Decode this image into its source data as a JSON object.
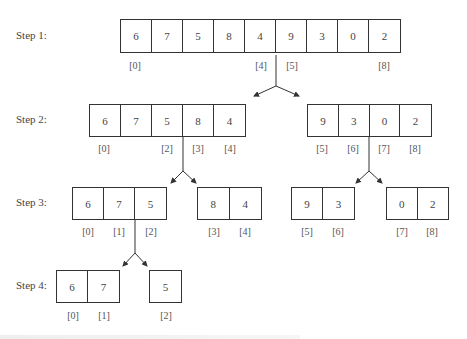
{
  "diagram": {
    "steps": [
      {
        "label": "Step 1:",
        "arrays": [
          {
            "values": [
              "6",
              "7",
              "5",
              "8",
              "4",
              "9",
              "3",
              "0",
              "2"
            ],
            "index_labels": [
              {
                "pos": 0,
                "text": "[0]"
              },
              {
                "pos": 4,
                "text": "[4]"
              },
              {
                "pos": 5,
                "text": "[5]"
              },
              {
                "pos": 8,
                "text": "[8]"
              }
            ]
          }
        ]
      },
      {
        "label": "Step 2:",
        "arrays": [
          {
            "values": [
              "6",
              "7",
              "5",
              "8",
              "4"
            ],
            "index_labels": [
              {
                "pos": 0,
                "text": "[0]"
              },
              {
                "pos": 2,
                "text": "[2]"
              },
              {
                "pos": 3,
                "text": "[3]"
              },
              {
                "pos": 4,
                "text": "[4]"
              }
            ]
          },
          {
            "values": [
              "9",
              "3",
              "0",
              "2"
            ],
            "index_labels": [
              {
                "pos": 0,
                "text": "[5]"
              },
              {
                "pos": 1,
                "text": "[6]"
              },
              {
                "pos": 2,
                "text": "[7]"
              },
              {
                "pos": 3,
                "text": "[8]"
              }
            ]
          }
        ]
      },
      {
        "label": "Step 3:",
        "arrays": [
          {
            "values": [
              "6",
              "7",
              "5"
            ],
            "index_labels": [
              {
                "pos": 0,
                "text": "[0]"
              },
              {
                "pos": 1,
                "text": "[1]"
              },
              {
                "pos": 2,
                "text": "[2]"
              }
            ]
          },
          {
            "values": [
              "8",
              "4"
            ],
            "index_labels": [
              {
                "pos": 0,
                "text": "[3]"
              },
              {
                "pos": 1,
                "text": "[4]"
              }
            ]
          },
          {
            "values": [
              "9",
              "3"
            ],
            "index_labels": [
              {
                "pos": 0,
                "text": "[5]"
              },
              {
                "pos": 1,
                "text": "[6]"
              }
            ]
          },
          {
            "values": [
              "0",
              "2"
            ],
            "index_labels": [
              {
                "pos": 0,
                "text": "[7]"
              },
              {
                "pos": 1,
                "text": "[8]"
              }
            ]
          }
        ]
      },
      {
        "label": "Step 4:",
        "arrays": [
          {
            "values": [
              "6",
              "7"
            ],
            "index_labels": [
              {
                "pos": 0,
                "text": "[0]"
              },
              {
                "pos": 1,
                "text": "[1]"
              }
            ]
          },
          {
            "values": [
              "5"
            ],
            "index_labels": [
              {
                "pos": 0,
                "text": "[2]"
              }
            ]
          }
        ]
      }
    ]
  }
}
